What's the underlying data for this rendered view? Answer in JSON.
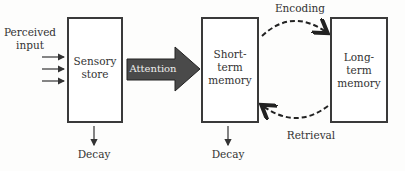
{
  "diagram": {
    "type": "memory-model-flow",
    "input": {
      "label_line1": "Perceived",
      "label_line2": "input",
      "arrow_count": 3
    },
    "boxes": [
      {
        "id": "sensory",
        "line1": "Sensory",
        "line2": "store",
        "line3": ""
      },
      {
        "id": "short_term",
        "line1": "Short-",
        "line2": "term",
        "line3": "memory"
      },
      {
        "id": "long_term",
        "line1": "Long-",
        "line2": "term",
        "line3": "memory"
      }
    ],
    "attention_label": "Attention",
    "encoding_label": "Encoding",
    "retrieval_label": "Retrieval",
    "decay_sensory": "Decay",
    "decay_short_term": "Decay"
  },
  "colors": {
    "box_border": "#3a3a3a",
    "attention_fill": "#4a4a4a",
    "attention_text": "#eeeeee",
    "dashed_arrow": "#2a2a2a"
  }
}
